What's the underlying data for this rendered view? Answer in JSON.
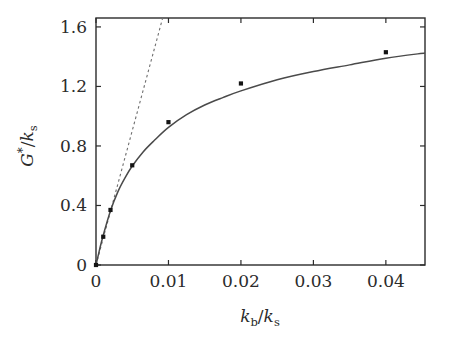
{
  "chart_data": {
    "type": "scatter",
    "title": "",
    "xlabel": "k_b/k_s",
    "ylabel": "G*/k_s",
    "xlim": [
      0,
      0.0454
    ],
    "ylim": [
      0,
      1.66
    ],
    "grid": false,
    "legend": "none",
    "xticks": [
      0,
      0.01,
      0.02,
      0.03,
      0.04
    ],
    "xticklabels": [
      "0",
      "0.01",
      "0.02",
      "0.03",
      "0.04"
    ],
    "yticks": [
      0,
      0.4,
      0.8,
      1.2,
      1.6
    ],
    "yticklabels": [
      "0",
      "0.4",
      "0.8",
      "1.2",
      "1.6"
    ],
    "series": [
      {
        "name": "simulation data",
        "type": "scatter",
        "marker": "filled-square",
        "color": "#141414",
        "x": [
          0.0,
          0.001,
          0.002,
          0.005,
          0.01,
          0.02,
          0.04
        ],
        "y": [
          0.0,
          0.19,
          0.37,
          0.67,
          0.96,
          1.22,
          1.43
        ]
      },
      {
        "name": "fitted curve",
        "type": "line",
        "style": "solid",
        "color": "#4a4a4a",
        "x": [
          0.0,
          0.0005,
          0.001,
          0.002,
          0.003,
          0.004,
          0.005,
          0.0065,
          0.008,
          0.01,
          0.0125,
          0.015,
          0.0175,
          0.02,
          0.025,
          0.03,
          0.035,
          0.04,
          0.0454
        ],
        "y": [
          0.0,
          0.105,
          0.2,
          0.365,
          0.49,
          0.585,
          0.665,
          0.76,
          0.835,
          0.925,
          1.01,
          1.075,
          1.125,
          1.17,
          1.245,
          1.3,
          1.345,
          1.39,
          1.425
        ]
      },
      {
        "name": "initial slope tangent",
        "type": "line",
        "style": "dashed",
        "color": "#6e6e6e",
        "x": [
          0.0,
          0.0092
        ],
        "y": [
          0.0,
          1.66
        ]
      }
    ]
  },
  "axes": {
    "x_title_parts": {
      "k": "k",
      "b": "b",
      "slash": "/",
      "k2": "k",
      "s": "s"
    },
    "y_title_parts": {
      "G": "G",
      "star": "*",
      "slash": "/",
      "k": "k",
      "s": "s"
    }
  },
  "figure": {
    "background": "#ffffff",
    "frame_color": "#2b2b2b",
    "point_color": "#141414",
    "curve_color": "#4a4a4a",
    "dashed_color": "#6e6e6e"
  }
}
